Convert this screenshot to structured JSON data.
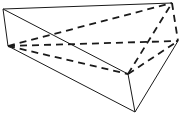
{
  "diagram": {
    "type": "triangular-prism-wireframe",
    "background": "#ffffff",
    "stroke_color": "#1a1a1a",
    "vertices": {
      "A": [
        3,
        9
      ],
      "B": [
        172,
        3
      ],
      "C": [
        178,
        41
      ],
      "D": [
        8,
        46
      ],
      "E": [
        128,
        74
      ],
      "F": [
        135,
        112
      ]
    },
    "solid_edges": [
      [
        "A",
        "B"
      ],
      [
        "A",
        "E"
      ],
      [
        "A",
        "D"
      ],
      [
        "D",
        "F"
      ],
      [
        "E",
        "F"
      ],
      [
        "C",
        "F"
      ]
    ],
    "dashed_edges": [
      [
        "D",
        "B"
      ],
      [
        "D",
        "C"
      ],
      [
        "D",
        "E"
      ],
      [
        "E",
        "B"
      ],
      [
        "E",
        "C"
      ],
      [
        "B",
        "C"
      ]
    ]
  }
}
